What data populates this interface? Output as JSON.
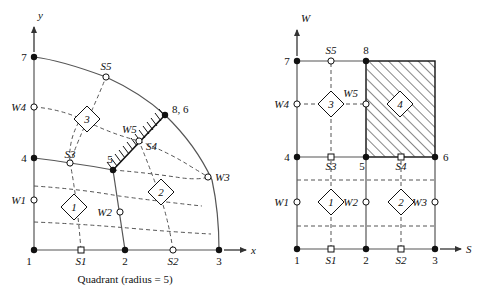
{
  "figure": {
    "caption": "Quadrant (radius = 5)",
    "radius": 5,
    "panels": [
      "quadrant",
      "computational"
    ]
  },
  "colors": {
    "line": "#444444",
    "stroke": "#111111",
    "node_fill": "#111111",
    "open_fill": "#ffffff",
    "hatch": "#222222",
    "text": "#111111"
  },
  "left": {
    "axis_y_label": "y",
    "axis_x_label": "x",
    "corner_nodes": [
      {
        "name": "n1",
        "label": "1",
        "x": 34,
        "y": 250
      },
      {
        "name": "n2",
        "label": "2",
        "x": 125,
        "y": 250
      },
      {
        "name": "n3",
        "label": "3",
        "x": 219,
        "y": 250
      },
      {
        "name": "n4",
        "label": "4",
        "x": 34,
        "y": 158
      },
      {
        "name": "n5",
        "label": "5",
        "x": 113,
        "y": 170
      },
      {
        "name": "n7",
        "label": "7",
        "x": 34,
        "y": 57
      },
      {
        "name": "n86",
        "label": "8, 6",
        "x": 165,
        "y": 115
      }
    ],
    "side_nodes": [
      {
        "name": "S1",
        "label": "S1",
        "x": 81,
        "y": 250,
        "shape": "square"
      },
      {
        "name": "S2",
        "label": "S2",
        "x": 173,
        "y": 250,
        "shape": "circle"
      },
      {
        "name": "S3",
        "label": "S3",
        "x": 70,
        "y": 163,
        "shape": "circle"
      },
      {
        "name": "S4",
        "label": "S4",
        "x": 139,
        "y": 141,
        "shape": "circle"
      },
      {
        "name": "S5",
        "label": "S5",
        "x": 106,
        "y": 77,
        "shape": "circle"
      },
      {
        "name": "W1",
        "label": "W1",
        "x": 34,
        "y": 200,
        "shape": "circle"
      },
      {
        "name": "W2",
        "label": "W2",
        "x": 120,
        "y": 212,
        "shape": "circle"
      },
      {
        "name": "W3",
        "label": "W3",
        "x": 208,
        "y": 177,
        "shape": "circle"
      },
      {
        "name": "W4",
        "label": "W4",
        "x": 34,
        "y": 107,
        "shape": "circle"
      },
      {
        "name": "W5",
        "label": "W5",
        "x": 139,
        "y": 141,
        "shape": "none"
      }
    ],
    "elements": [
      {
        "id": "1",
        "x": 74,
        "y": 207
      },
      {
        "id": "2",
        "x": 161,
        "y": 192
      },
      {
        "id": "3",
        "x": 87,
        "y": 119
      }
    ],
    "hatched_edge": {
      "from": "5",
      "to": "8, 6"
    }
  },
  "right": {
    "axis_w_label": "W",
    "axis_s_label": "S",
    "axis_x_label": "x",
    "corner_nodes": [
      {
        "name": "r1",
        "label": "1",
        "x": 297,
        "y": 249
      },
      {
        "name": "r2",
        "label": "2",
        "x": 366,
        "y": 249
      },
      {
        "name": "r3",
        "label": "3",
        "x": 435,
        "y": 249
      },
      {
        "name": "r4",
        "label": "4",
        "x": 297,
        "y": 157
      },
      {
        "name": "r5",
        "label": "5",
        "x": 366,
        "y": 157
      },
      {
        "name": "r6",
        "label": "6",
        "x": 435,
        "y": 157
      },
      {
        "name": "r7",
        "label": "7",
        "x": 297,
        "y": 61
      },
      {
        "name": "r8",
        "label": "8",
        "x": 366,
        "y": 61
      }
    ],
    "side_nodes": [
      {
        "name": "S1",
        "label": "S1",
        "x": 331,
        "y": 249,
        "shape": "square"
      },
      {
        "name": "S2",
        "label": "S2",
        "x": 401,
        "y": 249,
        "shape": "square"
      },
      {
        "name": "S3",
        "label": "S3",
        "x": 331,
        "y": 157,
        "shape": "square"
      },
      {
        "name": "S4",
        "label": "S4",
        "x": 401,
        "y": 157,
        "shape": "square"
      },
      {
        "name": "S5",
        "label": "S5",
        "x": 331,
        "y": 61,
        "shape": "circle"
      },
      {
        "name": "W1",
        "label": "W1",
        "x": 297,
        "y": 202,
        "shape": "circle"
      },
      {
        "name": "W2",
        "label": "W2",
        "x": 366,
        "y": 202,
        "shape": "circle"
      },
      {
        "name": "W3",
        "label": "W3",
        "x": 435,
        "y": 202,
        "shape": "circle"
      },
      {
        "name": "W4",
        "label": "W4",
        "x": 297,
        "y": 104,
        "shape": "circle"
      },
      {
        "name": "W5",
        "label": "W5",
        "x": 366,
        "y": 104,
        "shape": "circle"
      }
    ],
    "elements": [
      {
        "id": "1",
        "x": 331,
        "y": 202
      },
      {
        "id": "2",
        "x": 401,
        "y": 202
      },
      {
        "id": "3",
        "x": 331,
        "y": 104
      },
      {
        "id": "4",
        "x": 400,
        "y": 104
      }
    ],
    "hatched_region": {
      "x": 366,
      "y": 61,
      "width": 69,
      "height": 96,
      "element": "4"
    }
  }
}
